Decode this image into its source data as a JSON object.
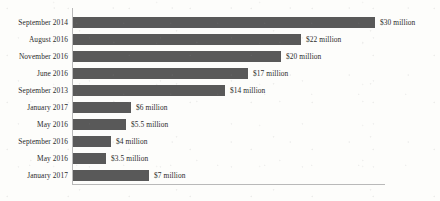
{
  "chart_data": {
    "type": "bar",
    "orientation": "horizontal",
    "title": "",
    "xlabel": "",
    "ylabel": "",
    "grid": false,
    "legend": false,
    "axis_color": "#b9b9b9",
    "bar_color": "#595959",
    "text_color": "#2b2b2b",
    "background_color": "#fdfdfb",
    "categories": [
      "September 2014",
      "August 2016",
      "November 2016",
      "June 2016",
      "September 2013",
      "January 2017",
      "May 2016",
      "September 2016",
      "May 2016",
      "January 2017"
    ],
    "values": [
      30,
      22,
      20,
      17,
      14,
      6,
      5.5,
      4,
      3.5,
      7
    ],
    "value_labels": [
      "$30 million",
      "$22 million",
      "$20 million",
      "$17 million",
      "$14 million",
      "$6 million",
      "$5.5 million",
      "$4 million",
      "$3.5 million",
      "$7 million"
    ],
    "bar_pixel_lengths": [
      302,
      228,
      208,
      175,
      152,
      58,
      53,
      38,
      33,
      76
    ],
    "unit": "million USD"
  },
  "rows": [
    {
      "category": "September 2014",
      "value_label": "$30 million",
      "bar_px": 302,
      "top": 14
    },
    {
      "category": "August 2016",
      "value_label": "$22 million",
      "bar_px": 228,
      "top": 31
    },
    {
      "category": "November 2016",
      "value_label": "$20 million",
      "bar_px": 208,
      "top": 48
    },
    {
      "category": "June 2016",
      "value_label": "$17 million",
      "bar_px": 175,
      "top": 65
    },
    {
      "category": "September 2013",
      "value_label": "$14 million",
      "bar_px": 152,
      "top": 82
    },
    {
      "category": "January 2017",
      "value_label": "$6 million",
      "bar_px": 58,
      "top": 99
    },
    {
      "category": "May 2016",
      "value_label": "$5.5 million",
      "bar_px": 53,
      "top": 116
    },
    {
      "category": "September 2016",
      "value_label": "$4 million",
      "bar_px": 38,
      "top": 133
    },
    {
      "category": "May 2016",
      "value_label": "$3.5 million",
      "bar_px": 33,
      "top": 150
    },
    {
      "category": "January 2017",
      "value_label": "$7 million",
      "bar_px": 76,
      "top": 167
    }
  ]
}
